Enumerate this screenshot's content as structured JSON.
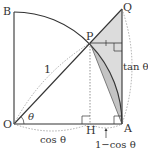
{
  "diagram": {
    "colors": {
      "line": "#333333",
      "shade": "#d9d9d9",
      "shade_dark": "#bdbdbd",
      "dashed": "#777777",
      "background": "#ffffff"
    },
    "points": {
      "O": {
        "label": "O",
        "x": 14,
        "y": 124
      },
      "A": {
        "label": "A",
        "x": 122,
        "y": 124
      },
      "B": {
        "label": "B",
        "x": 14,
        "y": 12
      },
      "P": {
        "label": "P",
        "x": 90,
        "y": 43
      },
      "H": {
        "label": "H",
        "x": 90,
        "y": 124
      },
      "Q": {
        "label": "Q",
        "x": 122,
        "y": 9
      }
    },
    "labels": {
      "radius": "1",
      "angle": "θ",
      "cos": "cos θ",
      "tan": "tan θ",
      "one_minus_cos": "1−cos θ"
    }
  }
}
